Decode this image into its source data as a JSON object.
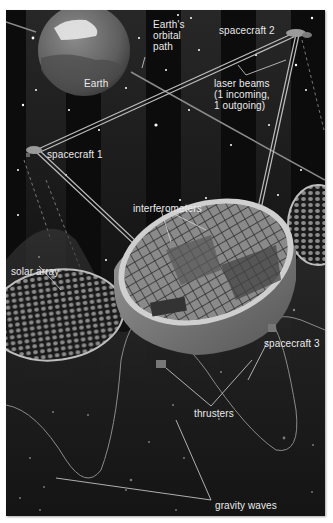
{
  "diagram": {
    "background_color": "#0c0c0c",
    "label_color": "#eaeaea",
    "labels": {
      "earth": "Earth",
      "orbital_path": "Earth's\norbital\npath",
      "spacecraft_1": "spacecraft 1",
      "spacecraft_2": "spacecraft 2",
      "spacecraft_3": "spacecraft 3",
      "laser_beams": "laser beams\n(1 incoming,\n1 outgoing)",
      "interferometers": "interferometers",
      "solar_array": "solar array",
      "thrusters": "thrusters",
      "gravity_waves": "gravity waves"
    },
    "components": [
      "earth",
      "earth-orbital-path",
      "spacecraft-1",
      "spacecraft-2",
      "spacecraft-3",
      "laser-beams",
      "interferometers",
      "solar-arrays",
      "thrusters",
      "gravity-waves",
      "stars"
    ]
  }
}
